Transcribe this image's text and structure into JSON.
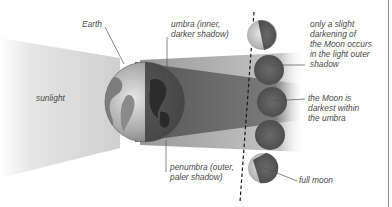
{
  "diagram": {
    "labels": {
      "earth": "Earth",
      "sunlight": "sunlight",
      "umbra": "umbra (inner,\ndarker shadow)",
      "penumbra": "penumbra (outer,\npaler shadow)",
      "slight_darkening": "only a slight\ndarkening of\nthe Moon occurs\nin the light outer\nshadow",
      "darkest": "the Moon is\ndarkest within\nthe umbra",
      "full_moon": "full moon"
    },
    "colors": {
      "background": "#ffffff",
      "sunlight": "#d6d6d6",
      "penumbra": "#b9b9b9",
      "umbra": "#6e6e6e",
      "moon_dark": "#5f5f5f",
      "moon_lit": "#c9c9c9",
      "label_text": "#4a4a4a",
      "leader_line": "#555555"
    },
    "moons": [
      {
        "name": "partially-lit-moon-top",
        "state": "partial"
      },
      {
        "name": "penumbral-moon-upper",
        "state": "penumbra"
      },
      {
        "name": "umbral-moon",
        "state": "umbra"
      },
      {
        "name": "penumbral-moon-lower",
        "state": "penumbra"
      },
      {
        "name": "full-moon",
        "state": "partial"
      }
    ]
  }
}
